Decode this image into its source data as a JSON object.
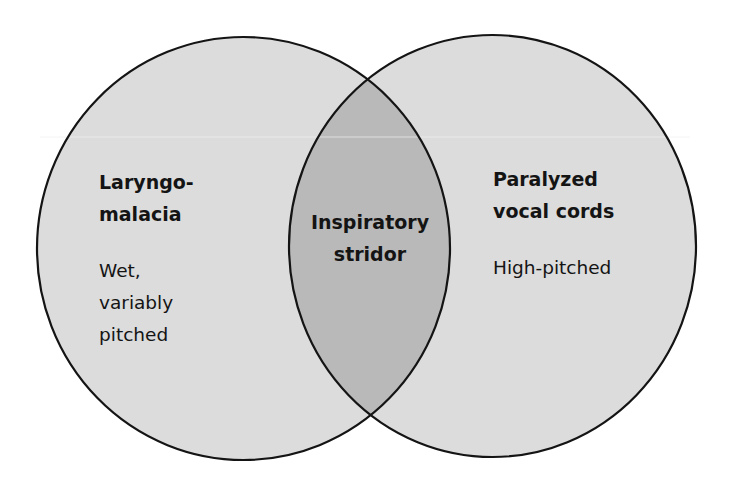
{
  "diagram": {
    "type": "venn",
    "colors": {
      "background": "#ffffff",
      "circle_fill": "#dcdcdc",
      "overlap_fill": "#b9b9b9",
      "stroke": "#141414",
      "text": "#141414"
    },
    "left_set": {
      "title_lines": [
        "Laryngo-",
        "malacia"
      ],
      "description_lines": [
        "Wet,",
        "variably",
        "pitched"
      ]
    },
    "overlap": {
      "title_lines": [
        "Inspiratory",
        "stridor"
      ]
    },
    "right_set": {
      "title_lines": [
        "Paralyzed",
        "vocal cords"
      ],
      "description_lines": [
        "High-pitched"
      ]
    }
  }
}
